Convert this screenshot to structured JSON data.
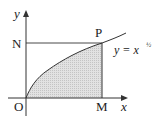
{
  "diagram": {
    "type": "area-under-curve",
    "labels": {
      "origin": "O",
      "y_axis": "y",
      "x_axis": "x",
      "point_n": "N",
      "point_p": "P",
      "point_m": "M",
      "curve_eq_prefix": "y = x",
      "curve_exponent": "½"
    },
    "colors": {
      "line": "#333333",
      "shade": "#d9d9d9"
    }
  }
}
